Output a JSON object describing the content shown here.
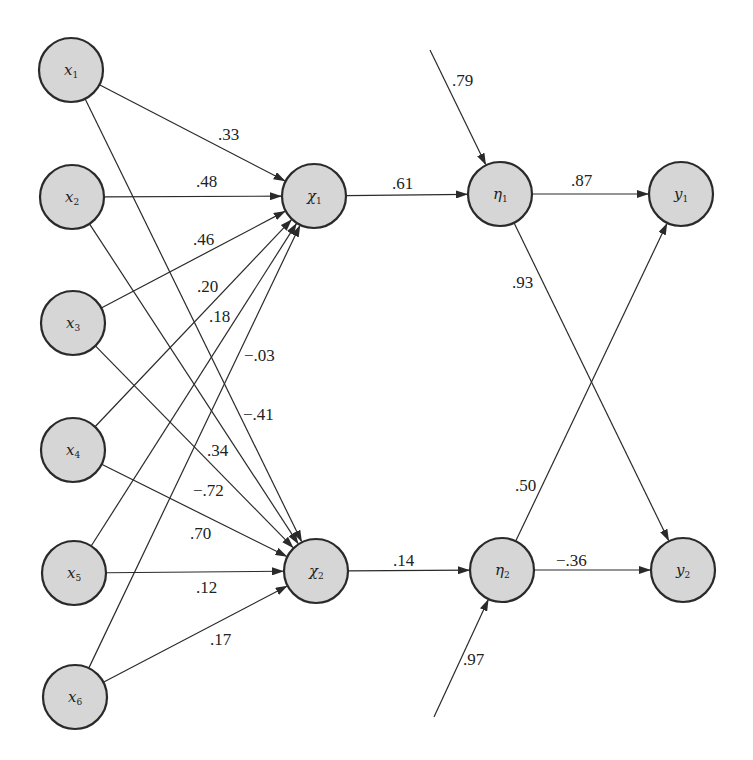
{
  "diagram": {
    "type": "path-diagram",
    "nodes": [
      {
        "id": "x1",
        "label": "x",
        "sub": "1",
        "cx": 71,
        "cy": 70
      },
      {
        "id": "x2",
        "label": "x",
        "sub": "2",
        "cx": 72,
        "cy": 197
      },
      {
        "id": "x3",
        "label": "x",
        "sub": "3",
        "cx": 73,
        "cy": 323
      },
      {
        "id": "x4",
        "label": "x",
        "sub": "4",
        "cx": 73,
        "cy": 450
      },
      {
        "id": "x5",
        "label": "x",
        "sub": "5",
        "cx": 74,
        "cy": 573
      },
      {
        "id": "x6",
        "label": "x",
        "sub": "6",
        "cx": 75,
        "cy": 697
      },
      {
        "id": "chi1",
        "label": "χ",
        "sub": "1",
        "cx": 314,
        "cy": 196
      },
      {
        "id": "chi2",
        "label": "χ",
        "sub": "2",
        "cx": 316,
        "cy": 571
      },
      {
        "id": "eta1",
        "label": "η",
        "sub": "1",
        "cx": 500,
        "cy": 194
      },
      {
        "id": "eta2",
        "label": "η",
        "sub": "2",
        "cx": 502,
        "cy": 570
      },
      {
        "id": "y1",
        "label": "y",
        "sub": "1",
        "cx": 681,
        "cy": 194
      },
      {
        "id": "y2",
        "label": "y",
        "sub": "2",
        "cx": 683,
        "cy": 570
      }
    ],
    "edges": [
      {
        "from": "x1",
        "to": "chi1",
        "weight": ".33",
        "lx": 218,
        "ly": 140
      },
      {
        "from": "x2",
        "to": "chi1",
        "weight": ".48",
        "lx": 196,
        "ly": 187
      },
      {
        "from": "x3",
        "to": "chi1",
        "weight": ".46",
        "lx": 193,
        "ly": 245
      },
      {
        "from": "x4",
        "to": "chi1",
        "weight": ".20",
        "lx": 197,
        "ly": 292
      },
      {
        "from": "x5",
        "to": "chi1",
        "weight": ".18",
        "lx": 209,
        "ly": 322
      },
      {
        "from": "x6",
        "to": "chi1",
        "weight": "−.03",
        "lx": 244,
        "ly": 361
      },
      {
        "from": "x1",
        "to": "chi2",
        "weight": "−.41",
        "lx": 243,
        "ly": 420
      },
      {
        "from": "x2",
        "to": "chi2",
        "weight": ".34",
        "lx": 207,
        "ly": 456
      },
      {
        "from": "x3",
        "to": "chi2",
        "weight": "−.72",
        "lx": 193,
        "ly": 496
      },
      {
        "from": "x4",
        "to": "chi2",
        "weight": ".70",
        "lx": 190,
        "ly": 539
      },
      {
        "from": "x5",
        "to": "chi2",
        "weight": ".12",
        "lx": 196,
        "ly": 593
      },
      {
        "from": "x6",
        "to": "chi2",
        "weight": ".17",
        "lx": 210,
        "ly": 645
      },
      {
        "from": "chi1",
        "to": "eta1",
        "weight": ".61",
        "lx": 392,
        "ly": 189
      },
      {
        "from": "chi2",
        "to": "eta2",
        "weight": ".14",
        "lx": 393,
        "ly": 566
      },
      {
        "from": "eta1",
        "to": "y1",
        "weight": ".87",
        "lx": 571,
        "ly": 186
      },
      {
        "from": "eta1",
        "to": "y2",
        "weight": ".93",
        "lx": 512,
        "ly": 288
      },
      {
        "from": "eta2",
        "to": "y1",
        "weight": ".50",
        "lx": 515,
        "ly": 491
      },
      {
        "from": "eta2",
        "to": "y2",
        "weight": "−.36",
        "lx": 556,
        "ly": 566
      }
    ],
    "errors": [
      {
        "to": "eta1",
        "weight": ".79",
        "x1": 430,
        "y1": 50,
        "lx": 452,
        "ly": 86
      },
      {
        "to": "eta2",
        "weight": ".97",
        "x1": 434,
        "y1": 717,
        "lx": 463,
        "ly": 665
      }
    ]
  }
}
